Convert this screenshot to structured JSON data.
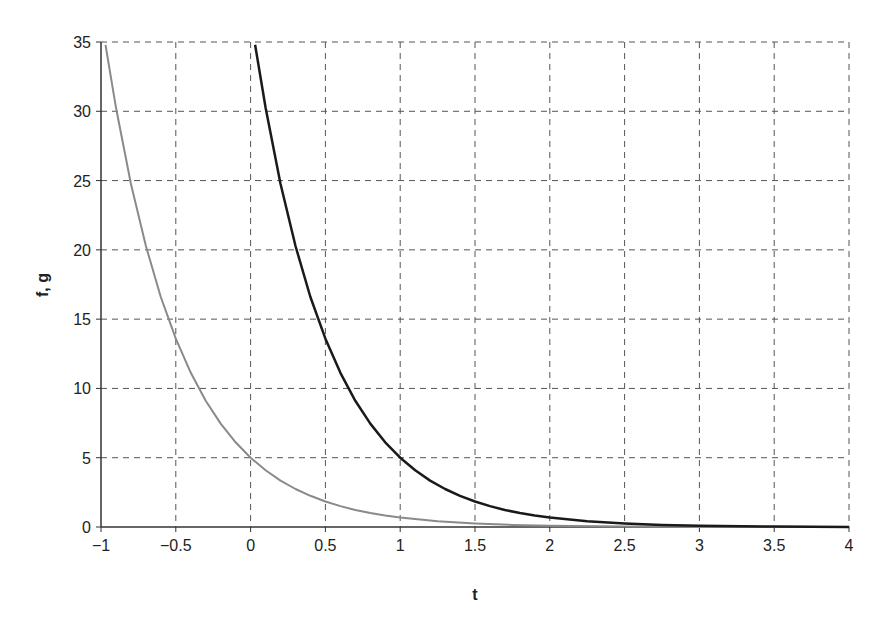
{
  "chart_data": {
    "type": "line",
    "title": "",
    "xlabel": "t",
    "ylabel": "f, g",
    "xlim": [
      -1,
      4
    ],
    "ylim": [
      0,
      35
    ],
    "xticks": [
      -1,
      -0.5,
      0,
      0.5,
      1,
      1.5,
      2,
      2.5,
      3,
      3.5,
      4
    ],
    "xtick_labels": [
      "−1",
      "−0.5",
      "0",
      "0.5",
      "1",
      "1.5",
      "2",
      "2.5",
      "3",
      "3.5",
      "4"
    ],
    "yticks": [
      0,
      5,
      10,
      15,
      20,
      25,
      30,
      35
    ],
    "ytick_labels": [
      "0",
      "5",
      "10",
      "15",
      "20",
      "25",
      "30",
      "35"
    ],
    "grid": true,
    "grid_style": "dashed",
    "legend": null,
    "series": [
      {
        "name": "f",
        "color": "#8a8a8a",
        "line_width": 2,
        "x": [
          -0.97,
          -0.9,
          -0.8,
          -0.7,
          -0.6,
          -0.5,
          -0.4,
          -0.3,
          -0.2,
          -0.1,
          0,
          0.1,
          0.2,
          0.3,
          0.4,
          0.5,
          0.6,
          0.7,
          0.8,
          0.9,
          1,
          1.25,
          1.5,
          1.75,
          2,
          2.5,
          3,
          3.5,
          4
        ],
        "values": [
          34.8,
          30.25,
          24.77,
          20.28,
          16.6,
          13.59,
          11.13,
          9.11,
          7.46,
          6.11,
          5.0,
          4.09,
          3.35,
          2.74,
          2.25,
          1.84,
          1.51,
          1.23,
          1.01,
          0.83,
          0.68,
          0.41,
          0.25,
          0.15,
          0.09,
          0.03,
          0.01,
          0.0,
          0.0
        ]
      },
      {
        "name": "g",
        "color": "#1a1a1a",
        "line_width": 2.5,
        "x": [
          0.03,
          0.1,
          0.2,
          0.3,
          0.4,
          0.5,
          0.6,
          0.7,
          0.8,
          0.9,
          1,
          1.1,
          1.2,
          1.3,
          1.4,
          1.5,
          1.6,
          1.7,
          1.8,
          1.9,
          2,
          2.25,
          2.5,
          2.75,
          3,
          3.5,
          4
        ],
        "values": [
          34.8,
          30.25,
          24.77,
          20.28,
          16.6,
          13.59,
          11.13,
          9.11,
          7.46,
          6.11,
          5.0,
          4.09,
          3.35,
          2.74,
          2.25,
          1.84,
          1.51,
          1.23,
          1.01,
          0.83,
          0.68,
          0.41,
          0.25,
          0.15,
          0.09,
          0.03,
          0.01
        ]
      }
    ]
  },
  "plot_area": {
    "left": 101,
    "right": 849,
    "top": 42,
    "bottom": 527
  }
}
